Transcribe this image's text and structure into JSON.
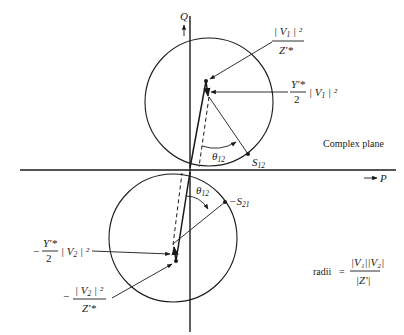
{
  "figure": {
    "type": "power circle diagram",
    "axes": {
      "vertical_label": "Q",
      "horizontal_label": "P",
      "arrow_glyph": "→"
    },
    "plane_label": "Complex plane",
    "upper_circle": {
      "center_label": {
        "numerator": "| V",
        "numerator_sub": "1",
        "numerator_tail": " | ²",
        "denominator": "Z'*"
      },
      "offset_label": {
        "numerator": "Y'*",
        "denominator": "2",
        "tail": "| V",
        "tail_sub": "1",
        "tail_end": " | ²"
      },
      "angle_label": {
        "symbol": "θ",
        "sub": "12"
      },
      "point_label": {
        "symbol": "S",
        "sub": "12"
      }
    },
    "lower_circle": {
      "center_label": {
        "sign": "−",
        "numerator": "| V",
        "numerator_sub": "2",
        "numerator_tail": " | ²",
        "denominator": "Z'*"
      },
      "offset_label": {
        "sign": "−",
        "numerator": "Y'*",
        "denominator": "2",
        "tail": "| V",
        "tail_sub": "2",
        "tail_end": " | ²"
      },
      "angle_label": {
        "symbol": "θ",
        "sub": "12"
      },
      "point_label": {
        "sign": "−",
        "symbol": "S",
        "sub": "21"
      }
    },
    "radii_formula": {
      "prefix": "radii",
      "equals": "=",
      "numerator": "|V₁||V₂|",
      "denominator": "|Z'|"
    }
  }
}
